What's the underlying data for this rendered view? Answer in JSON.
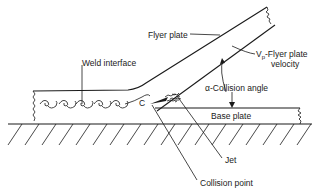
{
  "diagram": {
    "labels": {
      "flyer_plate": "Flyer plate",
      "flyer_velocity_symbol": "V",
      "flyer_velocity_subscript": "p",
      "flyer_velocity": "-Flyer plate",
      "flyer_velocity_line2": "velocity",
      "collision_angle": "α-Collision angle",
      "weld_interface": "Weld interface",
      "base_plate": "Base plate",
      "jet": "Jet",
      "collision_point": "Collision point",
      "collision_point_marker": "C"
    },
    "components": [
      "flyer plate",
      "base plate",
      "weld interface",
      "jet",
      "collision point",
      "ground"
    ]
  }
}
